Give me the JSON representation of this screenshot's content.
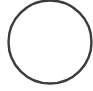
{
  "icon": {
    "name": "circle-outline-icon",
    "shape": "circle",
    "center": [
      50,
      42
    ],
    "radius": 41.5,
    "stroke_width": 2.4,
    "stroke_color": "#3c3c3c",
    "fill_color": "#ffffff"
  },
  "colors": {
    "background": "#ffffff"
  }
}
